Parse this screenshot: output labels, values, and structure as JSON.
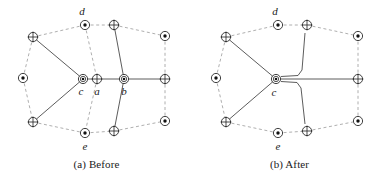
{
  "figure": {
    "panels": [
      {
        "id": "before",
        "caption": "(a) Before",
        "labels": {
          "d": "d",
          "c": "c",
          "a": "a",
          "b": "b",
          "e": "e"
        }
      },
      {
        "id": "after",
        "caption": "(b) After",
        "labels": {
          "d": "d",
          "c": "c",
          "e": "e"
        }
      }
    ],
    "glyph_types": {
      "cross": "crossed-circle-node",
      "dot": "dotted-circle-node",
      "double_dot": "double-circle-dot-node"
    },
    "colors": {
      "solid_edge": "#4a4a4a",
      "dashed_edge": "#9a9a9a",
      "node_stroke": "#2b2b2b",
      "background": "#ffffff"
    }
  }
}
